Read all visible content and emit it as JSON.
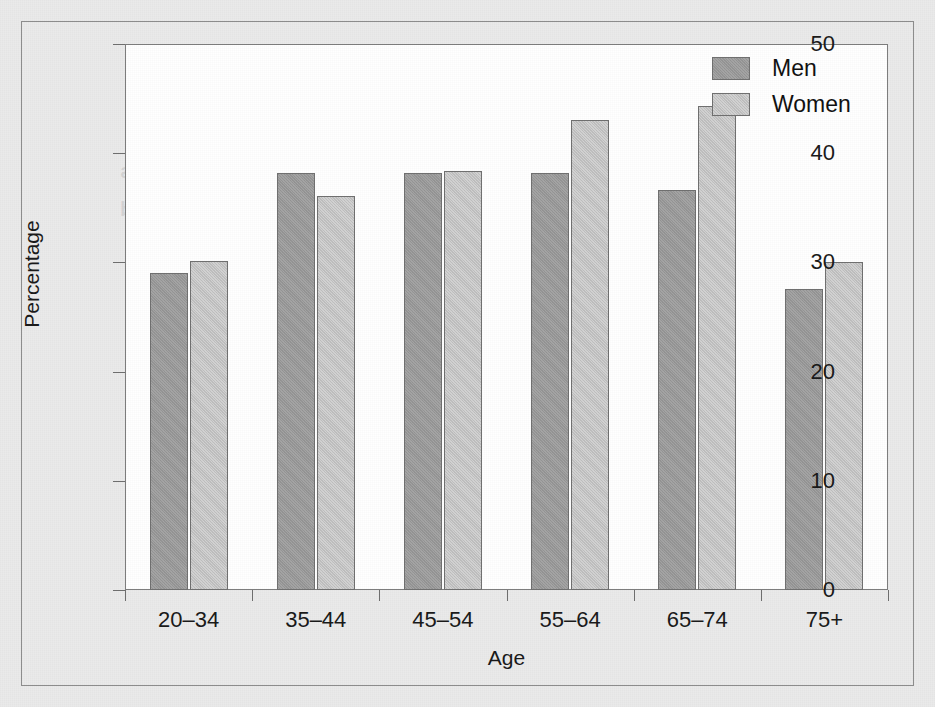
{
  "chart_data": {
    "type": "bar",
    "title": "",
    "xlabel": "Age",
    "ylabel": "Percentage",
    "categories": [
      "20–34",
      "35–44",
      "45–54",
      "55–64",
      "65–74",
      "75+"
    ],
    "series": [
      {
        "name": "Men",
        "color": "#9b9b9b",
        "values": [
          29.0,
          38.2,
          38.2,
          38.2,
          36.6,
          27.6
        ]
      },
      {
        "name": "Women",
        "color": "#c6c6c6",
        "values": [
          30.1,
          36.1,
          38.4,
          43.0,
          44.3,
          30.0
        ]
      }
    ],
    "ylim": [
      0,
      50
    ],
    "yticks": [
      "0",
      "10",
      "20",
      "30",
      "40",
      "50"
    ],
    "grid": false,
    "legend_position": "top-right"
  },
  "legend": {
    "items": [
      {
        "label": "Men"
      },
      {
        "label": "Women"
      }
    ]
  },
  "background_bleed": [
    {
      "text": "Hearing and Disability in Old Age",
      "left": 150,
      "top": 104,
      "size": 30
    },
    {
      "text": "prevalence of hearing loss increases",
      "left": 120,
      "top": 160,
      "size": 20
    },
    {
      "text": "with advancing age in both men and",
      "left": 120,
      "top": 198,
      "size": 20
    },
    {
      "text": "women, as shown in the figure",
      "left": 150,
      "top": 236,
      "size": 20
    },
    {
      "text": "below. Reported difficulty with",
      "left": 200,
      "top": 300,
      "size": 20
    },
    {
      "text": "hearing among adults by sex",
      "left": 180,
      "top": 346,
      "size": 20
    },
    {
      "text": "and age group is summarized",
      "left": 160,
      "top": 392,
      "size": 20
    },
    {
      "text": "in the following chart of the",
      "left": 200,
      "top": 438,
      "size": 20
    },
    {
      "text": "survey results collected",
      "left": 240,
      "top": 484,
      "size": 20
    }
  ]
}
